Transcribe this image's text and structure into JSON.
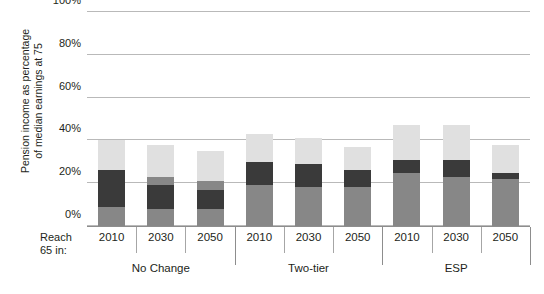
{
  "chart_data": {
    "type": "bar",
    "stacked": true,
    "title": "",
    "subtitle": "",
    "xlabel": "Reach 65 in:",
    "ylabel": "Pension income as percentage of median earnings at 75",
    "ylim": [
      0,
      100
    ],
    "yticks": [
      0,
      20,
      40,
      60,
      80,
      100
    ],
    "ytick_labels": [
      "0%",
      "20%",
      "40%",
      "60%",
      "80%",
      "100%"
    ],
    "grid": true,
    "legend": "none",
    "groups": [
      "No Change",
      "Two-tier",
      "ESP"
    ],
    "categories": [
      "2010",
      "2030",
      "2050",
      "2010",
      "2030",
      "2050",
      "2010",
      "2030",
      "2050"
    ],
    "series": [
      {
        "name": "tier-1-base",
        "color": "#878787",
        "values": [
          9,
          8,
          8,
          19,
          18,
          18,
          25,
          23,
          22
        ]
      },
      {
        "name": "tier-2-dark",
        "color": "#3a3a3a",
        "values": [
          17,
          11,
          9,
          11,
          11,
          8,
          6,
          8,
          3
        ]
      },
      {
        "name": "tier-3-mid",
        "color": "#878787",
        "values": [
          0,
          4,
          4,
          0,
          0,
          0,
          0,
          0,
          0
        ]
      },
      {
        "name": "tier-4-light",
        "color": "#e0e0e0",
        "values": [
          14,
          15,
          14,
          13,
          12,
          11,
          16,
          16,
          13
        ]
      }
    ],
    "bar_totals": [
      40,
      38,
      35,
      43,
      41,
      37,
      47,
      47,
      38
    ],
    "bars": [
      {
        "group": "No Change",
        "year": "2010",
        "segments": [
          {
            "from": 0,
            "to": 9,
            "color": "#878787"
          },
          {
            "from": 9,
            "to": 26,
            "color": "#3a3a3a"
          },
          {
            "from": 26,
            "to": 40,
            "color": "#e0e0e0"
          }
        ]
      },
      {
        "group": "No Change",
        "year": "2030",
        "segments": [
          {
            "from": 0,
            "to": 8,
            "color": "#878787"
          },
          {
            "from": 8,
            "to": 19,
            "color": "#3a3a3a"
          },
          {
            "from": 19,
            "to": 23,
            "color": "#878787"
          },
          {
            "from": 23,
            "to": 38,
            "color": "#e0e0e0"
          }
        ]
      },
      {
        "group": "No Change",
        "year": "2050",
        "segments": [
          {
            "from": 0,
            "to": 8,
            "color": "#878787"
          },
          {
            "from": 8,
            "to": 17,
            "color": "#3a3a3a"
          },
          {
            "from": 17,
            "to": 21,
            "color": "#878787"
          },
          {
            "from": 21,
            "to": 35,
            "color": "#e0e0e0"
          }
        ]
      },
      {
        "group": "Two-tier",
        "year": "2010",
        "segments": [
          {
            "from": 0,
            "to": 19,
            "color": "#878787"
          },
          {
            "from": 19,
            "to": 30,
            "color": "#3a3a3a"
          },
          {
            "from": 30,
            "to": 43,
            "color": "#e0e0e0"
          }
        ]
      },
      {
        "group": "Two-tier",
        "year": "2030",
        "segments": [
          {
            "from": 0,
            "to": 18,
            "color": "#878787"
          },
          {
            "from": 18,
            "to": 29,
            "color": "#3a3a3a"
          },
          {
            "from": 29,
            "to": 41,
            "color": "#e0e0e0"
          }
        ]
      },
      {
        "group": "Two-tier",
        "year": "2050",
        "segments": [
          {
            "from": 0,
            "to": 18,
            "color": "#878787"
          },
          {
            "from": 18,
            "to": 26,
            "color": "#3a3a3a"
          },
          {
            "from": 26,
            "to": 37,
            "color": "#e0e0e0"
          }
        ]
      },
      {
        "group": "ESP",
        "year": "2010",
        "segments": [
          {
            "from": 0,
            "to": 25,
            "color": "#878787"
          },
          {
            "from": 25,
            "to": 31,
            "color": "#3a3a3a"
          },
          {
            "from": 31,
            "to": 47,
            "color": "#e0e0e0"
          }
        ]
      },
      {
        "group": "ESP",
        "year": "2030",
        "segments": [
          {
            "from": 0,
            "to": 23,
            "color": "#878787"
          },
          {
            "from": 23,
            "to": 31,
            "color": "#3a3a3a"
          },
          {
            "from": 31,
            "to": 47,
            "color": "#e0e0e0"
          }
        ]
      },
      {
        "group": "ESP",
        "year": "2050",
        "segments": [
          {
            "from": 0,
            "to": 22,
            "color": "#878787"
          },
          {
            "from": 22,
            "to": 25,
            "color": "#3a3a3a"
          },
          {
            "from": 25,
            "to": 38,
            "color": "#e0e0e0"
          }
        ]
      }
    ]
  },
  "axis": {
    "y_title": "Pension income as percentage\nof median earnings at 75",
    "x_prefix": "Reach\n65 in:"
  },
  "colors": {
    "gridline": "#b9b9b9",
    "baseline": "#8d8d8d",
    "text": "#231f20",
    "background": "#ffffff"
  }
}
